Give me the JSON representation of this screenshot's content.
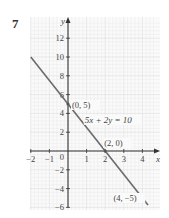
{
  "problem": {
    "number": "7"
  },
  "chart_data": {
    "type": "line",
    "title": "",
    "xlabel": "x",
    "ylabel": "y",
    "xlim": [
      -2,
      4.5
    ],
    "ylim": [
      -6,
      13
    ],
    "grid": true,
    "x_ticks": [
      -2,
      -1,
      1,
      2,
      3,
      4
    ],
    "x_tick_labels": [
      "−2",
      "−1",
      "1",
      "2",
      "3",
      "4"
    ],
    "y_ticks": [
      12,
      10,
      8,
      6,
      4,
      2,
      -2,
      -4,
      -6
    ],
    "y_tick_labels": [
      "12",
      "10",
      "8",
      "6",
      "4",
      "2",
      "−2",
      "−4",
      "−6"
    ],
    "origin_label": "0",
    "series": [
      {
        "name": "5x + 2y = 10",
        "equation": "5x + 2y = 10",
        "x": [
          -2,
          4.3
        ],
        "y": [
          10,
          -5.75
        ],
        "color": "#6b6b6b"
      }
    ],
    "points": [
      {
        "x": 0,
        "y": 5,
        "label": "(0, 5)"
      },
      {
        "x": 2,
        "y": 0,
        "label": "(2, 0)"
      },
      {
        "x": 4,
        "y": -5,
        "label": "(4, −5)"
      }
    ],
    "annotations": [
      {
        "text": "5x + 2y = 10",
        "x": 0.9,
        "y": 3
      }
    ]
  },
  "colors": {
    "line": "#6b6b6b",
    "axis": "#333333",
    "grid_minor": "#ececec",
    "grid_major": "#dcdcdc"
  }
}
